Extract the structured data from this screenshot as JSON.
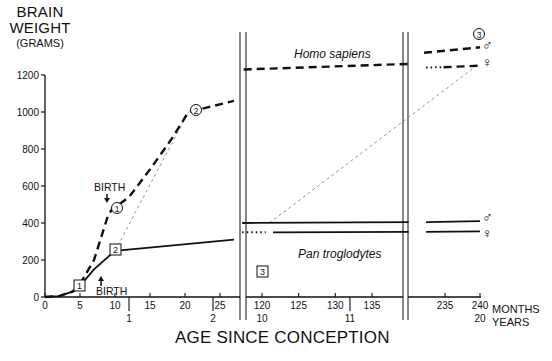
{
  "title": {
    "ylabel_line1": "BRAIN",
    "ylabel_line2": "WEIGHT",
    "ylabel_unit": "(GRAMS)",
    "xlabel": "AGE SINCE CONCEPTION"
  },
  "annotations": {
    "birth_upper": "BIRTH",
    "birth_lower": "BIRTH",
    "homo_label": "Homo sapiens",
    "pan_label": "Pan troglodytes",
    "marker_1": "1",
    "marker_2": "2",
    "marker_3": "3",
    "marker_c1": "1",
    "marker_c2": "2",
    "marker_c3": "3",
    "male_symbol": "♂",
    "female_symbol": "♀",
    "months_unit": "MONTHS",
    "years_unit": "YEARS"
  },
  "chart_data": {
    "type": "line",
    "title": "",
    "xlabel": "AGE SINCE CONCEPTION",
    "ylabel": "BRAIN WEIGHT (GRAMS)",
    "ylim": [
      0,
      1200
    ],
    "yticks": [
      0,
      200,
      400,
      600,
      800,
      1000,
      1200
    ],
    "x_segments": [
      {
        "range_months": [
          0,
          27
        ],
        "month_ticks": [
          0,
          5,
          10,
          15,
          20,
          25
        ],
        "year_ticks": [
          {
            "month": 12,
            "label": "1"
          },
          {
            "month": 24,
            "label": "2"
          }
        ]
      },
      {
        "range_months": [
          117,
          140
        ],
        "month_ticks": [
          120,
          125,
          130,
          135
        ],
        "year_ticks": [
          {
            "month": 120,
            "label": "10"
          },
          {
            "month": 132,
            "label": "11"
          }
        ]
      },
      {
        "range_months": [
          232,
          240
        ],
        "month_ticks": [
          235,
          240
        ],
        "year_ticks": [
          {
            "month": 240,
            "label": "20"
          }
        ]
      }
    ],
    "x_units": {
      "primary": "MONTHS",
      "secondary": "YEARS"
    },
    "axis_breaks": [
      "between 27 and 117 months",
      "between 140 and 232 months"
    ],
    "series": [
      {
        "name": "Homo sapiens",
        "style": "dashed",
        "points": [
          [
            0,
            0
          ],
          [
            2,
            5
          ],
          [
            4,
            30
          ],
          [
            5,
            70
          ],
          [
            7,
            200
          ],
          [
            8,
            320
          ],
          [
            9,
            440
          ],
          [
            9.5,
            470
          ],
          [
            12,
            540
          ],
          [
            15,
            690
          ],
          [
            18,
            850
          ],
          [
            20.5,
            1000
          ],
          [
            27,
            1060
          ],
          [
            117,
            1230
          ],
          [
            140,
            1260
          ],
          [
            232,
            1280
          ],
          [
            240,
            1300
          ]
        ]
      },
      {
        "name": "Homo sapiens male (adult)",
        "style": "dashed",
        "points": [
          [
            232,
            1320
          ],
          [
            240,
            1350
          ]
        ]
      },
      {
        "name": "Homo sapiens female (adult)",
        "style": "dotted-then-dashed",
        "points": [
          [
            232,
            1240
          ],
          [
            240,
            1250
          ]
        ]
      },
      {
        "name": "Pan troglodytes",
        "style": "solid",
        "points": [
          [
            0,
            0
          ],
          [
            2,
            5
          ],
          [
            4,
            30
          ],
          [
            5,
            60
          ],
          [
            7,
            150
          ],
          [
            10,
            250
          ],
          [
            27,
            310
          ],
          [
            117,
            400
          ],
          [
            140,
            405
          ],
          [
            232,
            405
          ],
          [
            240,
            410
          ]
        ]
      },
      {
        "name": "Pan troglodytes male (adult)",
        "style": "solid",
        "points": [
          [
            119,
            400
          ],
          [
            240,
            410
          ]
        ]
      },
      {
        "name": "Pan troglodytes female (adult)",
        "style": "dotted-then-solid",
        "points": [
          [
            117,
            350
          ],
          [
            240,
            355
          ]
        ]
      },
      {
        "name": "Comparison guide (Pan to Homo age equivalence)",
        "style": "thin-dashed-gray",
        "points": [
          [
            10,
            250
          ],
          [
            20.5,
            1000
          ]
        ]
      },
      {
        "name": "Comparison guide 2",
        "style": "thin-dashed-gray",
        "points": [
          [
            121,
            400
          ],
          [
            240,
            1260
          ]
        ]
      }
    ],
    "markers": [
      {
        "label": "1",
        "shape": "square",
        "month": 5,
        "value": 60,
        "series": "Pan troglodytes"
      },
      {
        "label": "2",
        "shape": "square",
        "month": 10,
        "value": 250,
        "series": "Pan troglodytes"
      },
      {
        "label": "3",
        "shape": "square",
        "month": 121,
        "value": 400,
        "series": "Pan troglodytes"
      },
      {
        "label": "1",
        "shape": "circle",
        "month": 9.5,
        "value": 470,
        "series": "Homo sapiens"
      },
      {
        "label": "2",
        "shape": "circle",
        "month": 20.5,
        "value": 1000,
        "series": "Homo sapiens"
      },
      {
        "label": "3",
        "shape": "circle",
        "month": 240,
        "value": 1350,
        "series": "Homo sapiens"
      }
    ],
    "event_annotations": [
      {
        "text": "BIRTH",
        "series": "Homo sapiens",
        "month": 9,
        "arrow": "down"
      },
      {
        "text": "BIRTH",
        "series": "Pan troglodytes",
        "month": 8,
        "arrow": "up"
      }
    ],
    "legend": "inline labels; ♂ male, ♀ female at right edge",
    "grid": false
  }
}
